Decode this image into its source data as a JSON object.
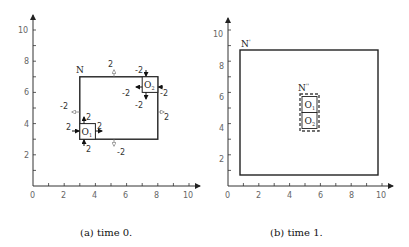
{
  "panels": [
    {
      "id": "a",
      "caption": "(a) time 0.",
      "x_ticks": [
        "0",
        "2",
        "4",
        "6",
        "8",
        "10"
      ],
      "y_ticks": [
        "2",
        "4",
        "6",
        "8",
        "10"
      ],
      "region_N": {
        "label": "N",
        "x1": 3,
        "y1": 3,
        "x2": 8,
        "y2": 7
      },
      "object_O1": {
        "label": "O",
        "sub": "1",
        "x1": 3,
        "y1": 3,
        "x2": 4,
        "y2": 4
      },
      "object_O2": {
        "label": "O",
        "sub": "2",
        "x1": 7,
        "y1": 6,
        "x2": 8,
        "y2": 7
      },
      "annotations": {
        "N_top": "2",
        "N_bottom": "-2",
        "N_left": "-2",
        "N_right": "2",
        "O1_left": "2",
        "O1_right": "2",
        "O1_top": "2",
        "O1_bottom": "2",
        "O2_top": "-2",
        "O2_bottom": "-2",
        "O2_left": "-2",
        "O2_right": "-2"
      }
    },
    {
      "id": "b",
      "caption": "(b) time 1.",
      "x_ticks": [
        "0",
        "2",
        "4",
        "6",
        "8",
        "10"
      ],
      "y_ticks": [
        "2",
        "4",
        "6",
        "8",
        "10"
      ],
      "region_N": {
        "label": "N",
        "sup": "'",
        "x1": 1,
        "y1": 1,
        "x2": 10,
        "y2": 9
      },
      "region_N2": {
        "label": "N",
        "sup": "''",
        "x1": 5,
        "y1": 4,
        "x2": 6,
        "y2": 6
      },
      "object_O1": {
        "label": "O",
        "sub": "1"
      },
      "object_O2": {
        "label": "O",
        "sub": "2"
      }
    }
  ]
}
